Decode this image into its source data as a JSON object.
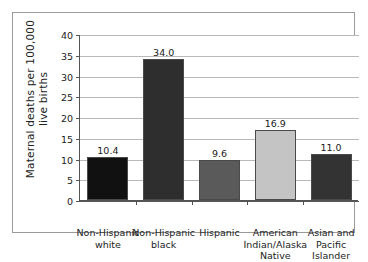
{
  "chart_data": {
    "type": "bar",
    "title": "",
    "subtitle": "",
    "xlabel": "",
    "ylabel": "Maternal deaths per 100,000\nlive births",
    "ylim": [
      0,
      40
    ],
    "ytick_step": 5,
    "yticks": [
      "0",
      "5",
      "10",
      "15",
      "20",
      "25",
      "30",
      "35",
      "40"
    ],
    "grid": true,
    "legend": "none",
    "categories": [
      "Non-Hispanic\nwhite",
      "Non-Hispanic\nblack",
      "Hispanic",
      "American\nIndian/Alaska\nNative",
      "Asian and\nPacific\nIslander"
    ],
    "values": [
      10.4,
      34.0,
      9.6,
      16.9,
      11.0
    ],
    "value_labels": [
      "10.4",
      "34.0",
      "9.6",
      "16.9",
      "11.0"
    ],
    "bar_colors": [
      "#111111",
      "#2e2e2e",
      "#5a5a5a",
      "#c4c4c4",
      "#333333"
    ],
    "bar_edge_color": "#4a4a4a",
    "axis_color": "#555555",
    "gridline_color": "#b9b9b9",
    "frame_color": "#9a9a9a",
    "background_color": "#ffffff"
  }
}
